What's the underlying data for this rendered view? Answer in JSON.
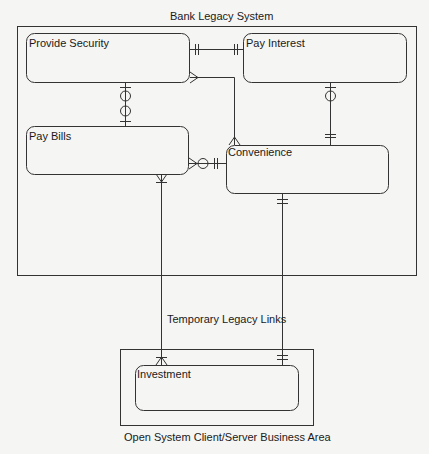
{
  "diagram": {
    "legacy_system": {
      "title": "Bank Legacy System"
    },
    "open_system": {
      "title": "Open System Client/Server Business Area"
    },
    "link_label": "Temporary Legacy Links",
    "entities": [
      {
        "id": "provide_security",
        "name": "Provide Security"
      },
      {
        "id": "pay_interest",
        "name": "Pay Interest"
      },
      {
        "id": "pay_bills",
        "name": "Pay Bills"
      },
      {
        "id": "convenience",
        "name": "Convenience"
      },
      {
        "id": "investment",
        "name": "Investment"
      }
    ],
    "relationships": [
      {
        "from": "Provide Security",
        "to": "Pay Interest",
        "from_end": "one-and-only-one",
        "to_end": "one-and-only-one"
      },
      {
        "from": "Provide Security",
        "to": "Pay Bills",
        "from_end": "zero-or-one",
        "to_end": "zero-or-one"
      },
      {
        "from": "Provide Security",
        "to": "Convenience",
        "from_end": "many",
        "to_end": "one-or-many"
      },
      {
        "from": "Pay Interest",
        "to": "Convenience",
        "from_end": "zero-or-one",
        "to_end": "one-and-only-one"
      },
      {
        "from": "Pay Bills",
        "to": "Convenience",
        "from_end": "zero-or-many",
        "to_end": "one-and-only-one"
      },
      {
        "from": "Pay Bills",
        "to": "Investment",
        "from_end": "one-or-many",
        "to_end": "one-or-many"
      },
      {
        "from": "Convenience",
        "to": "Investment",
        "from_end": "one-and-only-one",
        "to_end": "one-and-only-one"
      }
    ]
  }
}
